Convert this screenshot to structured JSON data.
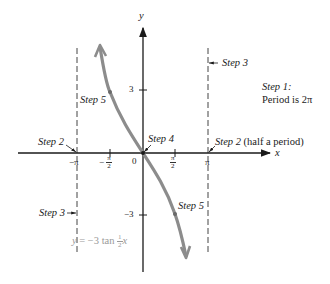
{
  "figure": {
    "type": "graph-of-tangent-function",
    "equation": {
      "lhs": "y",
      "rhs_prefix": "= −3 tan",
      "frac_num": "1",
      "frac_den": "2",
      "var": "x"
    },
    "axes": {
      "x_label": "x",
      "y_label": "y",
      "origin_label": "0",
      "x_ticks": [
        {
          "label": "−π",
          "value": "-pi"
        },
        {
          "label_prefix": "−",
          "num": "π",
          "den": "2",
          "value": "-pi/2"
        },
        {
          "num": "π",
          "den": "2",
          "value": "pi/2"
        },
        {
          "label": "π",
          "value": "pi"
        }
      ],
      "y_ticks": [
        {
          "label": "3",
          "value": 3
        },
        {
          "label": "−3",
          "value": -3
        }
      ]
    },
    "asymptotes": [
      "x = −π",
      "x = π"
    ],
    "annotations": {
      "step1_title": "Step 1:",
      "step1_text": "Period is 2π",
      "step2_left": "Step 2",
      "step2_right": "Step 2",
      "step2_right_suffix": " (half a period)",
      "step3_top": "Step 3",
      "step3_bottom": "Step 3",
      "step4": "Step 4",
      "step5_top": "Step 5",
      "step5_bottom": "Step 5"
    },
    "colors": {
      "axis": "#1a1a1a",
      "curve": "#8c8c8c",
      "asymptote": "#444444",
      "equation": "#9a9a9a"
    }
  }
}
